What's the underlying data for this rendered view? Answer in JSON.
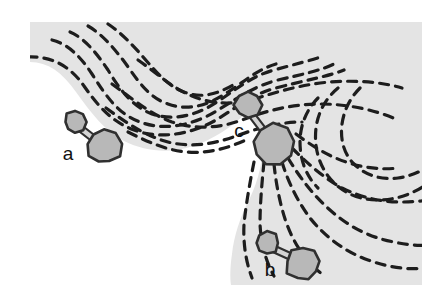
{
  "figure": {
    "domain": "diagram",
    "width": 447,
    "height": 306,
    "colors": {
      "page_background": "#ffffff",
      "region_fill": "#e4e4e4",
      "bay_fill": "#ffffff",
      "dash_stroke": "#1d1d1d",
      "marker_fill": "#b8b8b8",
      "marker_stroke": "#303030",
      "bond_fill": "#d4d4d4",
      "label_color": "#111111"
    },
    "region": {
      "name": "grey-substrate-region",
      "outline": "M 30,22 L 422,22 L 422,285 L 30,285 Z"
    },
    "bay": {
      "name": "white-bay-inlet",
      "path": "M 30,285 L 30,62 C 48,62 62,72 76,92 C 92,114 104,130 124,141 C 150,154 180,154 208,140 C 226,131 240,120 248,110 C 256,120 262,134 262,150 C 262,168 256,186 248,202 C 240,218 234,236 232,254 C 230,268 230,278 231,285 Z"
    },
    "labels": [
      {
        "id": "a",
        "text": "a",
        "x": 68,
        "y": 155
      },
      {
        "id": "b",
        "text": "b",
        "x": 270,
        "y": 271
      },
      {
        "id": "c",
        "text": "c",
        "x": 239,
        "y": 132
      }
    ],
    "markers": [
      {
        "id": "marker-a",
        "label": "a",
        "small_lobe": {
          "cx": 75,
          "cy": 122,
          "r": 11
        },
        "large_lobe": {
          "cx": 104,
          "cy": 147,
          "r": 17
        },
        "bond": {
          "x1": 80,
          "y1": 128,
          "x2": 98,
          "y2": 142
        }
      },
      {
        "id": "marker-b",
        "label": "b",
        "small_lobe": {
          "cx": 267,
          "cy": 243,
          "r": 12
        },
        "large_lobe": {
          "cx": 303,
          "cy": 264,
          "r": 17
        },
        "bond": {
          "x1": 274,
          "y1": 249,
          "x2": 296,
          "y2": 259
        }
      },
      {
        "id": "marker-c",
        "label": "c",
        "small_lobe": {
          "cx": 248,
          "cy": 105,
          "r": 13
        },
        "large_lobe": {
          "cx": 273,
          "cy": 145,
          "r": 20
        },
        "bond": {
          "x1": 251,
          "y1": 114,
          "x2": 267,
          "y2": 135
        }
      }
    ],
    "flow_lines": {
      "name": "dashed-contour-flow-lines",
      "dash_pattern": "9 7",
      "stroke_width": 3.2,
      "count": 16,
      "paths": [
        "M 28,57 C 52,56 70,66 84,86 C 98,106 112,122 134,130 C 160,140 192,134 216,120 C 236,108 252,94 276,88 C 306,80 330,76 344,70",
        "M 52,40 C 68,44 80,56 92,74 C 106,96 118,114 140,122 C 166,132 196,124 218,110 C 238,98 254,86 278,80 C 304,74 322,70 334,64",
        "M 70,32 C 84,38 96,52 108,70 C 120,90 132,106 152,114 C 176,122 200,114 220,100 C 238,88 252,76 274,70 C 296,64 312,60 324,56",
        "M 88,26 C 102,34 114,48 126,64 C 140,84 150,98 168,104 C 190,112 210,104 228,92 C 244,82 256,70 276,64",
        "M 108,24 C 120,32 132,44 144,58 C 158,74 168,86 184,92 C 204,100 222,92 238,82",
        "M 138,60 C 158,74 172,88 192,96 C 216,106 238,104 258,98 C 282,90 306,84 330,82 C 356,80 382,82 402,88",
        "M 112,84 C 134,100 150,114 172,122 C 196,130 220,128 242,120 C 268,110 294,104 320,104 C 348,104 376,110 398,120",
        "M 106,108 C 128,124 146,136 168,142 C 192,148 214,144 236,136 C 258,128 280,122 302,122",
        "M 128,132 C 148,142 166,150 186,152 C 208,154 228,148 246,140",
        "M 254,162 C 250,182 246,204 244,224 C 243,244 246,262 252,278",
        "M 264,162 C 262,182 260,204 260,224 C 261,244 266,262 274,276",
        "M 274,164 C 276,184 280,204 286,222 C 294,244 306,262 322,274",
        "M 282,162 C 288,182 298,202 310,218 C 326,238 346,252 368,260 C 390,268 410,270 424,268",
        "M 288,158 C 300,178 314,196 330,210 C 350,228 372,238 394,242 C 412,246 424,246 432,244",
        "M 292,148 C 308,164 324,178 342,188 C 362,198 382,202 402,202 C 418,202 430,200 438,198",
        "M 296,134 C 312,146 328,156 346,162 C 364,168 382,170 398,168"
      ],
      "right_arcs": [
        "M 338,88 C 326,98 318,112 316,128 C 314,146 318,162 328,176 C 340,192 358,200 378,200 C 396,200 412,194 424,186",
        "M 360,88 C 350,98 344,110 342,124 C 340,140 344,154 354,164 C 366,176 382,180 398,178 C 412,176 424,170 432,164",
        "M 318,98 C 306,110 300,126 300,142 C 300,160 306,176 318,188"
      ]
    }
  }
}
